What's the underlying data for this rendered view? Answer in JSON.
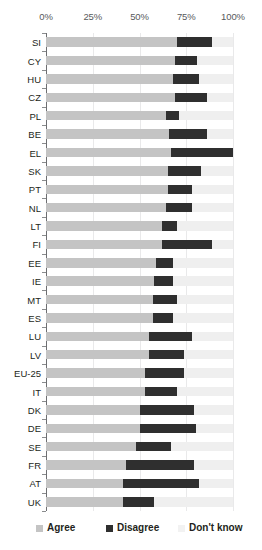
{
  "chart_data": {
    "type": "bar",
    "orientation": "horizontal",
    "stacked": true,
    "stacked_percent": true,
    "title": "",
    "subtitle": "",
    "xlabel": "",
    "ylabel": "",
    "xlim": [
      0,
      100
    ],
    "grid": true,
    "legend_position": "bottom",
    "x_ticks": [
      "0%",
      "25%",
      "50%",
      "75%",
      "100%"
    ],
    "x_tick_values": [
      0,
      25,
      50,
      75,
      100
    ],
    "legend": [
      "Agree",
      "Disagree",
      "Don't know"
    ],
    "series": [
      {
        "name": "Agree",
        "color": "#c4c4c4",
        "values": [
          70,
          69,
          68,
          69,
          64,
          66,
          67,
          65,
          65,
          64,
          62,
          62,
          59,
          58,
          57,
          57,
          55,
          55,
          53,
          53,
          50,
          50,
          48,
          43,
          41,
          41
        ]
      },
      {
        "name": "Disagree",
        "color": "#2f2f2f",
        "values": [
          19,
          12,
          14,
          17,
          7,
          20,
          33,
          18,
          13,
          14,
          8,
          27,
          9,
          10,
          13,
          11,
          23,
          19,
          21,
          17,
          29,
          30,
          19,
          36,
          41,
          17
        ]
      },
      {
        "name": "Don't know",
        "color": "#efefef",
        "values": [
          11,
          19,
          18,
          14,
          29,
          14,
          0,
          17,
          22,
          22,
          30,
          11,
          32,
          32,
          30,
          32,
          22,
          26,
          26,
          30,
          21,
          20,
          33,
          21,
          18,
          42
        ]
      }
    ],
    "categories": [
      "SI",
      "CY",
      "HU",
      "CZ",
      "PL",
      "BE",
      "EL",
      "SK",
      "PT",
      "NL",
      "LT",
      "FI",
      "EE",
      "IE",
      "MT",
      "ES",
      "LU",
      "LV",
      "EU-25",
      "IT",
      "DK",
      "DE",
      "SE",
      "FR",
      "AT",
      "UK"
    ],
    "rows": [
      {
        "label": "SI",
        "agree": 70,
        "disagree": 19,
        "dont_know": 11
      },
      {
        "label": "CY",
        "agree": 69,
        "disagree": 12,
        "dont_know": 19
      },
      {
        "label": "HU",
        "agree": 68,
        "disagree": 14,
        "dont_know": 18
      },
      {
        "label": "CZ",
        "agree": 69,
        "disagree": 17,
        "dont_know": 14
      },
      {
        "label": "PL",
        "agree": 64,
        "disagree": 7,
        "dont_know": 29
      },
      {
        "label": "BE",
        "agree": 66,
        "disagree": 20,
        "dont_know": 14
      },
      {
        "label": "EL",
        "agree": 67,
        "disagree": 33,
        "dont_know": 0
      },
      {
        "label": "SK",
        "agree": 65,
        "disagree": 18,
        "dont_know": 17
      },
      {
        "label": "PT",
        "agree": 65,
        "disagree": 13,
        "dont_know": 22
      },
      {
        "label": "NL",
        "agree": 64,
        "disagree": 14,
        "dont_know": 22
      },
      {
        "label": "LT",
        "agree": 62,
        "disagree": 8,
        "dont_know": 30
      },
      {
        "label": "FI",
        "agree": 62,
        "disagree": 27,
        "dont_know": 11
      },
      {
        "label": "EE",
        "agree": 59,
        "disagree": 9,
        "dont_know": 32
      },
      {
        "label": "IE",
        "agree": 58,
        "disagree": 10,
        "dont_know": 32
      },
      {
        "label": "MT",
        "agree": 57,
        "disagree": 13,
        "dont_know": 30
      },
      {
        "label": "ES",
        "agree": 57,
        "disagree": 11,
        "dont_know": 32
      },
      {
        "label": "LU",
        "agree": 55,
        "disagree": 23,
        "dont_know": 22
      },
      {
        "label": "LV",
        "agree": 55,
        "disagree": 19,
        "dont_know": 26
      },
      {
        "label": "EU-25",
        "agree": 53,
        "disagree": 21,
        "dont_know": 26
      },
      {
        "label": "IT",
        "agree": 53,
        "disagree": 17,
        "dont_know": 30
      },
      {
        "label": "DK",
        "agree": 50,
        "disagree": 29,
        "dont_know": 21
      },
      {
        "label": "DE",
        "agree": 50,
        "disagree": 30,
        "dont_know": 20
      },
      {
        "label": "SE",
        "agree": 48,
        "disagree": 19,
        "dont_know": 33
      },
      {
        "label": "FR",
        "agree": 43,
        "disagree": 36,
        "dont_know": 21
      },
      {
        "label": "AT",
        "agree": 41,
        "disagree": 41,
        "dont_know": 18
      },
      {
        "label": "UK",
        "agree": 41,
        "disagree": 17,
        "dont_know": 42
      }
    ]
  },
  "legend": {
    "items": [
      {
        "label": "Agree",
        "swatch": "agree"
      },
      {
        "label": "Disagree",
        "swatch": "disagree"
      },
      {
        "label": "Don't know",
        "swatch": "dontknow"
      }
    ]
  },
  "colors": {
    "agree": "#c4c4c4",
    "disagree": "#2f2f2f",
    "dont_know": "#efefef",
    "axis": "#6d6e71",
    "grid": "#e9e9ea",
    "text": "#231f20"
  }
}
